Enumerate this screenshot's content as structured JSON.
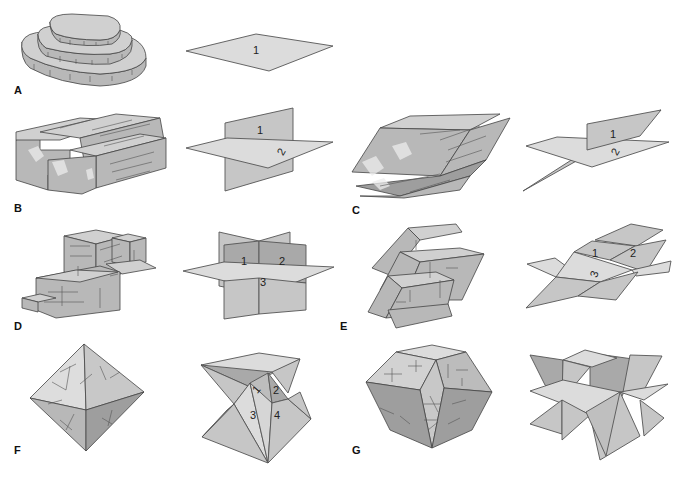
{
  "figure": {
    "panels": [
      {
        "id": "A",
        "label": "A",
        "description": "One direction of cleavage (basal)",
        "plane_numbers": [
          "1"
        ]
      },
      {
        "id": "B",
        "label": "B",
        "description": "Two directions of cleavage at 90 degrees",
        "plane_numbers": [
          "1",
          "2"
        ]
      },
      {
        "id": "C",
        "label": "C",
        "description": "Two directions of cleavage not at 90 degrees",
        "plane_numbers": [
          "1",
          "2"
        ]
      },
      {
        "id": "D",
        "label": "D",
        "description": "Three directions of cleavage at 90 degrees (cubic)",
        "plane_numbers": [
          "1",
          "2",
          "3"
        ]
      },
      {
        "id": "E",
        "label": "E",
        "description": "Three directions of cleavage not at 90 degrees (rhombohedral)",
        "plane_numbers": [
          "1",
          "2",
          "3"
        ]
      },
      {
        "id": "F",
        "label": "F",
        "description": "Four directions of cleavage (octahedral)",
        "plane_numbers": [
          "1",
          "2",
          "3",
          "4"
        ]
      },
      {
        "id": "G",
        "label": "G",
        "description": "Six directions of cleavage (dodecahedral)",
        "plane_numbers": []
      }
    ]
  },
  "colors": {
    "background": "#ffffff",
    "plane_light": "#dcdcdc",
    "plane_mid": "#c6c6c6",
    "plane_dark": "#a9a9a9",
    "outline": "#555555"
  }
}
